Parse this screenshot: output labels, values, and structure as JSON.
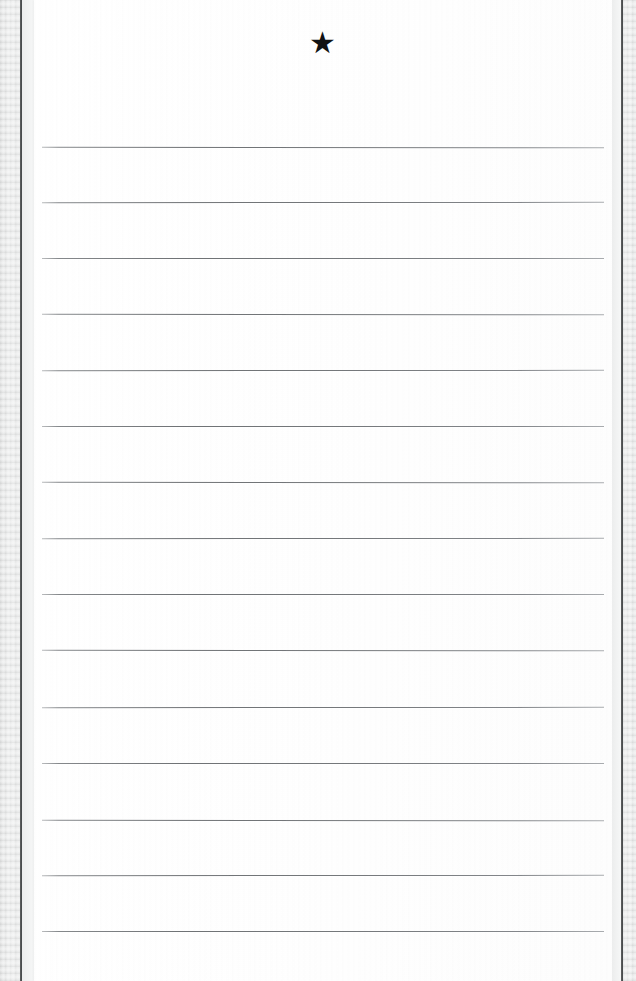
{
  "document": {
    "kind": "scanned-ruled-notebook-page",
    "page_width": 636,
    "page_height": 981,
    "background_color": "#eceded",
    "paper_color": "#ffffff",
    "rule_color": "#75787b",
    "spine_color": "#3c3e3f",
    "text_content": "",
    "handwriting_present": "none"
  },
  "marks": {
    "star": {
      "glyph": "★",
      "name": "star",
      "color": "#111213",
      "x": 324,
      "y": 44,
      "size": 30
    }
  },
  "sheet": {
    "left": 34,
    "top": 0,
    "width": 578,
    "height": 981
  },
  "edges": {
    "left_strip_width": 21,
    "right_strip_width": 14,
    "left_spine_x": 20,
    "right_spine_x": 621
  },
  "rules": {
    "count": 15,
    "left_x": 42,
    "right_x": 604,
    "spacing": 56,
    "y_positions": [
      147,
      202,
      258,
      314,
      370,
      426,
      482,
      538,
      594,
      650,
      707,
      763,
      820,
      875,
      931
    ]
  }
}
